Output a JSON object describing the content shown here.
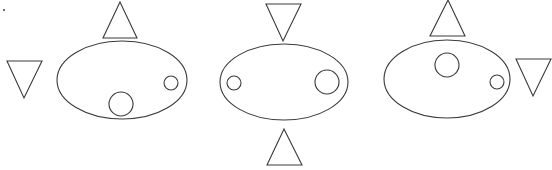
{
  "diagram": {
    "stroke_color": "#3a3a3a",
    "background": "#ffffff",
    "marker_dot": {
      "x": 4,
      "y": 10
    },
    "panels": [
      {
        "id": "panel-1",
        "ellipse": {
          "cx": 122,
          "cy": 80,
          "rx": 65,
          "ry": 39
        },
        "circles": [
          {
            "size": "large",
            "cx": 121,
            "cy": 104,
            "r": 12
          },
          {
            "size": "small",
            "cx": 171,
            "cy": 83,
            "r": 7
          }
        ],
        "triangles": [
          {
            "position": "top",
            "direction": "up",
            "points": "120,2 103,38 137,38"
          },
          {
            "position": "left",
            "direction": "down",
            "points": "7,61 42,61 24,98"
          }
        ]
      },
      {
        "id": "panel-2",
        "ellipse": {
          "cx": 284,
          "cy": 82,
          "rx": 64,
          "ry": 38
        },
        "circles": [
          {
            "size": "small",
            "cx": 234,
            "cy": 83,
            "r": 7
          },
          {
            "size": "large",
            "cx": 327,
            "cy": 82,
            "r": 12
          }
        ],
        "triangles": [
          {
            "position": "top",
            "direction": "down",
            "points": "266,4 301,4 283,41"
          },
          {
            "position": "bottom",
            "direction": "up",
            "points": "284,129 267,165 302,165"
          }
        ]
      },
      {
        "id": "panel-3",
        "ellipse": {
          "cx": 447,
          "cy": 79,
          "rx": 63,
          "ry": 39
        },
        "circles": [
          {
            "size": "large",
            "cx": 447,
            "cy": 65,
            "r": 12
          },
          {
            "size": "small",
            "cx": 497,
            "cy": 82,
            "r": 7
          }
        ],
        "triangles": [
          {
            "position": "top",
            "direction": "up",
            "points": "448,0 430,36 465,36"
          },
          {
            "position": "right",
            "direction": "down",
            "points": "516,59 551,59 533,96"
          }
        ]
      }
    ]
  }
}
